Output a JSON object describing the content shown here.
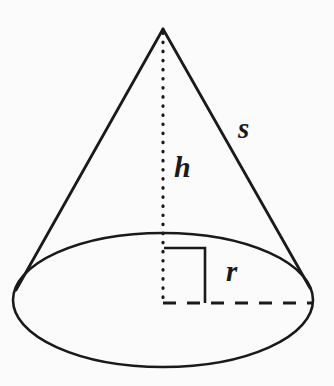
{
  "figure": {
    "kind": "geometry-diagram",
    "shape": "cone",
    "width": 334,
    "height": 386,
    "background_color": "#fbfbfb",
    "stroke_color": "#1a1a1a"
  },
  "labels": {
    "slant_height": "s",
    "height": "h",
    "radius": "r"
  },
  "geometry": {
    "apex": {
      "x": 163,
      "y": 29
    },
    "base_ellipse": {
      "cx": 163,
      "cy": 300,
      "rx": 150,
      "ry": 67
    },
    "height_line": {
      "x": 163,
      "y1": 33,
      "y2": 303,
      "style": "dotted"
    },
    "radius_line": {
      "y": 303,
      "x1": 163,
      "x2": 312,
      "style": "dashed"
    },
    "right_angle_marker": {
      "x1": 164,
      "y1": 248,
      "x2": 205,
      "y2": 303,
      "size": 41
    },
    "left_slant": {
      "x1": 163,
      "y1": 29,
      "x2": 16,
      "y2": 290
    },
    "right_slant": {
      "x1": 163,
      "y1": 29,
      "x2": 310,
      "y2": 288
    }
  }
}
